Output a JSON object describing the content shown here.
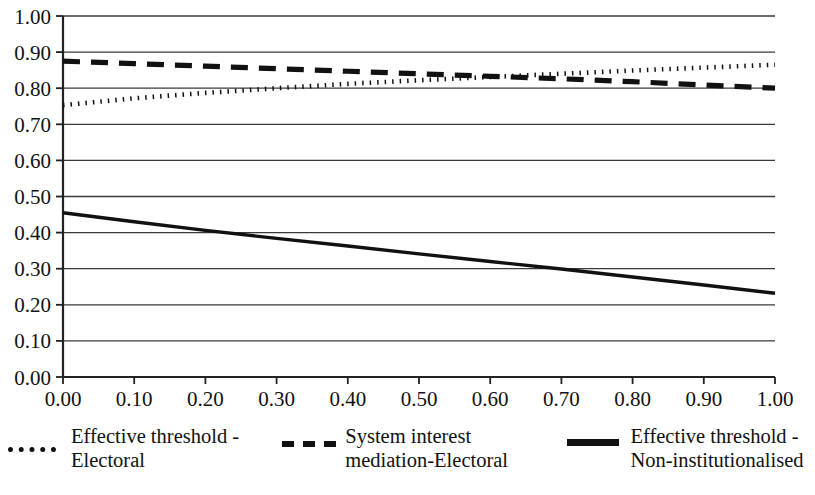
{
  "chart_data": {
    "type": "line",
    "title": "",
    "xlabel": "",
    "ylabel": "",
    "xlim": [
      0.0,
      1.0
    ],
    "ylim": [
      0.0,
      1.0
    ],
    "grid": "horizontal",
    "legend_position": "bottom",
    "x_tick_labels": [
      "0.00",
      "0.10",
      "0.20",
      "0.30",
      "0.40",
      "0.50",
      "0.60",
      "0.70",
      "0.80",
      "0.90",
      "1.00"
    ],
    "y_tick_labels": [
      "0.00",
      "0.10",
      "0.20",
      "0.30",
      "0.40",
      "0.50",
      "0.60",
      "0.70",
      "0.80",
      "0.90",
      "1.00"
    ],
    "x_ticks": [
      0.0,
      0.1,
      0.2,
      0.3,
      0.4,
      0.5,
      0.6,
      0.7,
      0.8,
      0.9,
      1.0
    ],
    "y_ticks": [
      0.0,
      0.1,
      0.2,
      0.3,
      0.4,
      0.5,
      0.6,
      0.7,
      0.8,
      0.9,
      1.0
    ],
    "x": [
      0.0,
      0.1,
      0.2,
      0.3,
      0.4,
      0.5,
      0.6,
      0.7,
      0.8,
      0.9,
      1.0
    ],
    "series": [
      {
        "name": "Effective threshold - Electoral",
        "style": "dotted",
        "color": "#111111",
        "values": [
          0.753,
          0.772,
          0.787,
          0.8,
          0.812,
          0.822,
          0.831,
          0.84,
          0.849,
          0.857,
          0.865
        ]
      },
      {
        "name": "System interest mediation-Electoral",
        "style": "dashed",
        "color": "#111111",
        "values": [
          0.875,
          0.868,
          0.861,
          0.854,
          0.847,
          0.84,
          0.833,
          0.826,
          0.818,
          0.809,
          0.8
        ]
      },
      {
        "name": "Effective threshold - Non-institutionalised",
        "style": "solid",
        "color": "#111111",
        "values": [
          0.455,
          0.43,
          0.406,
          0.384,
          0.363,
          0.341,
          0.32,
          0.299,
          0.277,
          0.255,
          0.232
        ]
      }
    ]
  },
  "legend": {
    "items": [
      {
        "label": "Effective threshold -\nElectoral",
        "sample": "dotted-line-sample"
      },
      {
        "label": "System interest\nmediation-Electoral",
        "sample": "dashed-line-sample"
      },
      {
        "label": "Effective threshold -\nNon-institutionalised",
        "sample": "solid-line-sample"
      }
    ]
  }
}
